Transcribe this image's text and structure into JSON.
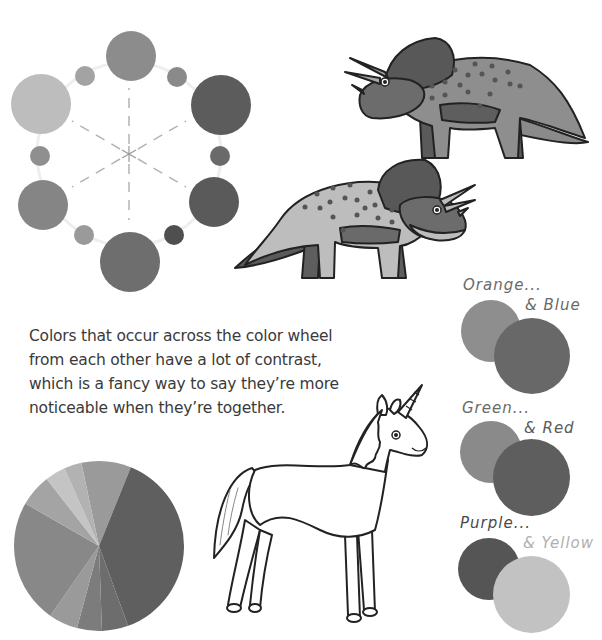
{
  "page": {
    "background": "#ffffff"
  },
  "color_wheel": {
    "large_circles": [
      {
        "name": "orange",
        "cx": 131,
        "cy": 56,
        "r": 25,
        "color": "#8c8c8c"
      },
      {
        "name": "red",
        "cx": 221,
        "cy": 105,
        "r": 30,
        "color": "#5c5c5c"
      },
      {
        "name": "purple",
        "cx": 214,
        "cy": 202,
        "r": 25,
        "color": "#5a5a5a"
      },
      {
        "name": "blue",
        "cx": 130,
        "cy": 262,
        "r": 30,
        "color": "#6e6e6e"
      },
      {
        "name": "green",
        "cx": 43,
        "cy": 205,
        "r": 25,
        "color": "#858585"
      },
      {
        "name": "yellow",
        "cx": 41,
        "cy": 104,
        "r": 30,
        "color": "#bdbdbd"
      }
    ],
    "small_circles": [
      {
        "name": "yellow-orange",
        "cx": 85,
        "cy": 76,
        "r": 10,
        "color": "#a3a3a3"
      },
      {
        "name": "red-orange",
        "cx": 177,
        "cy": 77,
        "r": 10,
        "color": "#8a8a8a"
      },
      {
        "name": "red-purple",
        "cx": 220,
        "cy": 156,
        "r": 10,
        "color": "#6a6a6a"
      },
      {
        "name": "blue-purple",
        "cx": 174,
        "cy": 235,
        "r": 10,
        "color": "#4f4f4f"
      },
      {
        "name": "blue-green",
        "cx": 84,
        "cy": 235,
        "r": 10,
        "color": "#9a9a9a"
      },
      {
        "name": "yellow-green",
        "cx": 40,
        "cy": 156,
        "r": 10,
        "color": "#8f8f8f"
      }
    ],
    "center": {
      "cx": 129,
      "cy": 154
    }
  },
  "description": {
    "lines": [
      "Colors that occur across the color wheel",
      "from each other have a lot of contrast,",
      "which is a fancy way to say they’re more",
      "noticeable when they’re together."
    ]
  },
  "pairs": [
    {
      "first_label": "Orange...",
      "second_label": "& Blue",
      "first_color": "#8e8e8e",
      "second_color": "#686868",
      "label_color": "#6a6a6a",
      "second_label_color": "#6a6a6a"
    },
    {
      "first_label": "Green...",
      "second_label": "& Red",
      "first_color": "#8a8a8a",
      "second_color": "#5e5e5e",
      "label_color": "#6a6a6a",
      "second_label_color": "#5a5a5a"
    },
    {
      "first_label": "Purple...",
      "second_label": "& Yellow",
      "first_color": "#555555",
      "second_color": "#c2c2c2",
      "label_color": "#4a4a4a",
      "second_label_color": "#b0b0b0"
    }
  ],
  "pie": {
    "cx": 99,
    "cy": 546,
    "r": 85,
    "slices": [
      {
        "start": -12,
        "end": 22,
        "color": "#9a9a9a"
      },
      {
        "start": 22,
        "end": 160,
        "color": "#5f5f5f"
      },
      {
        "start": 160,
        "end": 178,
        "color": "#6d6d6d"
      },
      {
        "start": 178,
        "end": 195,
        "color": "#7c7c7c"
      },
      {
        "start": 195,
        "end": 215,
        "color": "#9a9a9a"
      },
      {
        "start": 215,
        "end": 300,
        "color": "#888888"
      },
      {
        "start": 300,
        "end": 322,
        "color": "#a4a4a4"
      },
      {
        "start": 322,
        "end": 336,
        "color": "#c4c4c4"
      },
      {
        "start": 336,
        "end": 348,
        "color": "#b2b2b2"
      }
    ]
  },
  "illustrations": {
    "dino_top": "triceratops-dark",
    "dino_bottom": "triceratops-light",
    "unicorn": "unicorn-outline"
  }
}
